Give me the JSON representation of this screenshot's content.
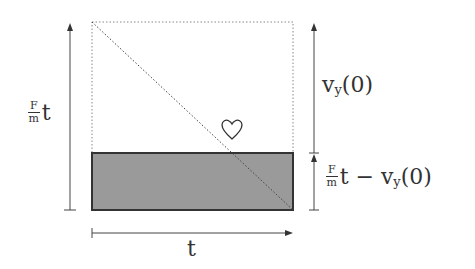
{
  "diagram": {
    "left_label": {
      "num": "F",
      "den": "m",
      "var": "t"
    },
    "right_upper_label": {
      "v": "v",
      "sub": "y",
      "arg": "(0)"
    },
    "right_lower_label": {
      "num": "F",
      "den": "m",
      "var": "t",
      "minus": " − ",
      "v": "v",
      "sub": "y",
      "arg": "(0)"
    },
    "bottom_label": "t",
    "marker_icon": "heart-outline",
    "colors": {
      "shaded": "#9a9a9a",
      "stroke": "#333333",
      "dotted": "#888888"
    }
  }
}
